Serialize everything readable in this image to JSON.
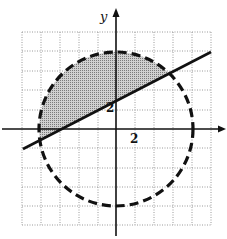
{
  "figure": {
    "type": "coordinate-plane-inequality-graph",
    "axes": {
      "x_label": "",
      "y_label": "y",
      "tick_label_x": "2",
      "tick_label_y": "2"
    },
    "grid": {
      "cells_x": 10,
      "cells_y": 10,
      "style": "dotted"
    },
    "circle": {
      "center": [
        0,
        0
      ],
      "radius_units": 4,
      "style": "dashed"
    },
    "line": {
      "description": "solid line with positive slope ~1/2, y-intercept ~1.5",
      "style": "solid"
    },
    "shaded_region": "inside circle and above the line"
  }
}
